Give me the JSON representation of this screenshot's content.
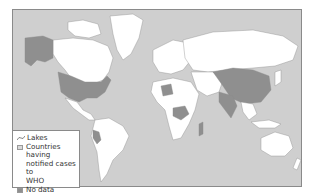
{
  "map": {
    "title": "",
    "colors": {
      "ocean": "#cfcfcf",
      "land_default": "#ffffff",
      "notified_cases": "#d9d9d9",
      "no_data": "#8f8f8f",
      "border": "#8a8a8a"
    },
    "highlighted_no_data_regions": [
      "Alaska",
      "United States",
      "China",
      "Peru",
      "India",
      "Central Africa",
      "Madagascar region"
    ]
  },
  "legend": {
    "items": [
      {
        "icon": "lakes-icon",
        "label": "Lakes"
      },
      {
        "icon": "light-swatch",
        "label_lines": [
          "Countries having",
          "notified cases to",
          "WHO"
        ]
      },
      {
        "icon": "dark-swatch",
        "label": "No data"
      }
    ]
  }
}
